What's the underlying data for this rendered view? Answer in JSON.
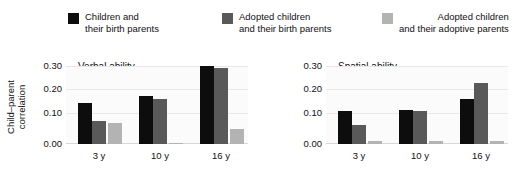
{
  "legend": {
    "items": [
      {
        "label_line1": "Children and",
        "label_line2": "their birth parents",
        "color": "#0d0d0d",
        "swatch_name": "legend-swatch-children-birth-parents"
      },
      {
        "label_line1": "Adopted children",
        "label_line2": "and their birth parents",
        "color": "#595959",
        "swatch_name": "legend-swatch-adopted-birth-parents"
      },
      {
        "label_line1": "Adopted children",
        "label_line2": "and their adoptive parents",
        "color": "#b3b3b3",
        "swatch_name": "legend-swatch-adopted-adoptive-parents"
      }
    ]
  },
  "axis": {
    "ylabel_line1": "Child–parent",
    "ylabel_line2": "correlation",
    "yticks": [
      "0.30",
      "0.20",
      "0.10",
      "0.00"
    ],
    "xticks": [
      "3 y",
      "10 y",
      "16 y"
    ]
  },
  "panels": [
    {
      "title": "Verbal ability"
    },
    {
      "title": "Spatial ability"
    }
  ],
  "chart_data": [
    {
      "type": "bar",
      "title": "Verbal ability",
      "xlabel": "",
      "ylabel": "Child–parent correlation",
      "categories": [
        "3 y",
        "10 y",
        "16 y"
      ],
      "ylim": [
        0.0,
        0.335
      ],
      "yticks": [
        0.0,
        0.1,
        0.2,
        0.3
      ],
      "grid": true,
      "legend_position": "top",
      "series": [
        {
          "name": "Children and their birth parents",
          "color": "#0d0d0d",
          "values": [
            0.175,
            0.205,
            0.335
          ]
        },
        {
          "name": "Adopted children and their birth parents",
          "color": "#595959",
          "values": [
            0.1,
            0.195,
            0.325
          ]
        },
        {
          "name": "Adopted children and their adoptive parents",
          "color": "#b3b3b3",
          "values": [
            0.09,
            0.005,
            0.065
          ]
        }
      ]
    },
    {
      "type": "bar",
      "title": "Spatial ability",
      "xlabel": "",
      "ylabel": "Child–parent correlation",
      "categories": [
        "3 y",
        "10 y",
        "16 y"
      ],
      "ylim": [
        0.0,
        0.335
      ],
      "yticks": [
        0.0,
        0.1,
        0.2,
        0.3
      ],
      "grid": true,
      "legend_position": "top",
      "series": [
        {
          "name": "Children and their birth parents",
          "color": "#0d0d0d",
          "values": [
            0.14,
            0.148,
            0.192
          ]
        },
        {
          "name": "Adopted children and their birth parents",
          "color": "#595959",
          "values": [
            0.08,
            0.14,
            0.262
          ]
        },
        {
          "name": "Adopted children and their adoptive parents",
          "color": "#b3b3b3",
          "values": [
            0.013,
            0.015,
            0.015
          ]
        }
      ]
    }
  ]
}
